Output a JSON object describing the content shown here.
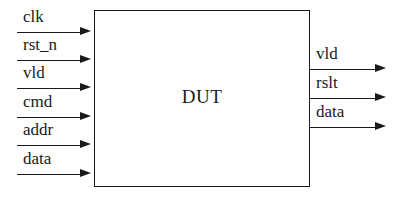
{
  "diagram": {
    "block": {
      "label": "DUT",
      "x": 94,
      "y": 10,
      "width": 216,
      "height": 177,
      "border_color": "#1a1a1a",
      "fill_color": "#ffffff"
    },
    "background_color": "#ffffff",
    "line_color": "#1a1a1a",
    "inputs": [
      {
        "label": "clk",
        "line_y": 32,
        "line_x_start": 17,
        "line_x_end": 80,
        "arrow_x": 80,
        "label_x": 23,
        "label_y": 8
      },
      {
        "label": "rst_n",
        "line_y": 60,
        "line_x_start": 17,
        "line_x_end": 80,
        "arrow_x": 80,
        "label_x": 23,
        "label_y": 36
      },
      {
        "label": "vld",
        "line_y": 88,
        "line_x_start": 17,
        "line_x_end": 80,
        "arrow_x": 80,
        "label_x": 23,
        "label_y": 64
      },
      {
        "label": "cmd",
        "line_y": 117,
        "line_x_start": 17,
        "line_x_end": 80,
        "arrow_x": 80,
        "label_x": 23,
        "label_y": 93
      },
      {
        "label": "addr",
        "line_y": 145,
        "line_x_start": 17,
        "line_x_end": 80,
        "arrow_x": 80,
        "label_x": 23,
        "label_y": 121
      },
      {
        "label": "data",
        "line_y": 174,
        "line_x_start": 17,
        "line_x_end": 80,
        "arrow_x": 80,
        "label_x": 23,
        "label_y": 150
      }
    ],
    "outputs": [
      {
        "label": "vld",
        "line_y": 69,
        "line_x_start": 310,
        "line_x_end": 375,
        "arrow_x": 375,
        "label_x": 316,
        "label_y": 45
      },
      {
        "label": "rslt",
        "line_y": 98,
        "line_x_start": 310,
        "line_x_end": 375,
        "arrow_x": 375,
        "label_x": 316,
        "label_y": 74
      },
      {
        "label": "data",
        "line_y": 127,
        "line_x_start": 310,
        "line_x_end": 375,
        "arrow_x": 375,
        "label_x": 316,
        "label_y": 103
      }
    ]
  }
}
